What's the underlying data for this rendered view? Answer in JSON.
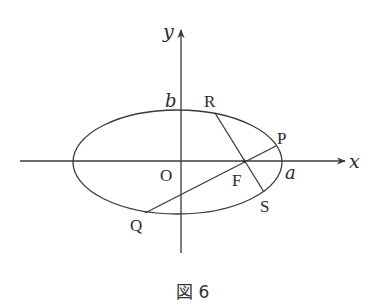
{
  "figure": {
    "caption": "図 6",
    "axes": {
      "x_label": "x",
      "y_label": "y"
    },
    "labels": {
      "origin": "O",
      "a": "a",
      "b": "b",
      "P": "P",
      "Q": "Q",
      "R": "R",
      "S": "S",
      "F": "F"
    },
    "geometry": {
      "ellipse": {
        "cx": 177.5,
        "cy": 162,
        "rx": 104.5,
        "ry": 52
      },
      "x_axis": {
        "x1": 20,
        "x2": 345,
        "y": 161
      },
      "y_axis": {
        "x": 181,
        "y1": 30,
        "y2": 253
      },
      "points": {
        "P": [
          276,
          146
        ],
        "Q": [
          145,
          213
        ],
        "R": [
          215,
          113
        ],
        "S": [
          264,
          192
        ],
        "F": [
          244,
          161
        ]
      },
      "chords": [
        {
          "name": "PQ",
          "from": "P",
          "to": "Q"
        },
        {
          "name": "RS",
          "from": "R",
          "to": "S"
        }
      ]
    },
    "colors": {
      "stroke": "#3a3a3a",
      "text": "#2a2a2a",
      "background": "#ffffff"
    }
  }
}
